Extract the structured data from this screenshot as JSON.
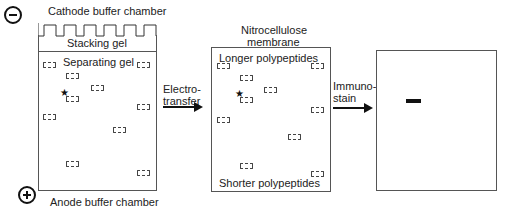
{
  "gel": {
    "cathode_label": "Cathode buffer chamber",
    "anode_label": "Anode buffer chamber",
    "stacking_label": "Stacking gel",
    "separating_label": "Separating gel",
    "cathode_symbol": "minus",
    "anode_symbol": "plus",
    "star": "★",
    "bands": [
      {
        "x": 44,
        "y": 64
      },
      {
        "x": 138,
        "y": 64
      },
      {
        "x": 67,
        "y": 75
      },
      {
        "x": 92,
        "y": 87
      },
      {
        "x": 67,
        "y": 98
      },
      {
        "x": 138,
        "y": 107
      },
      {
        "x": 44,
        "y": 117
      },
      {
        "x": 114,
        "y": 130
      },
      {
        "x": 67,
        "y": 163
      },
      {
        "x": 138,
        "y": 172
      }
    ]
  },
  "electrotransfer": {
    "line1": "Electro-",
    "line2": "transfer"
  },
  "membrane": {
    "title_line1": "Nitrocellulose",
    "title_line2": "membrane",
    "top_label": "Longer polypeptides",
    "bottom_label": "Shorter polypeptides",
    "star": "★"
  },
  "immunostain": {
    "line1": "Immuno-",
    "line2": "stain"
  },
  "result": {
    "band_color": "#111111"
  }
}
